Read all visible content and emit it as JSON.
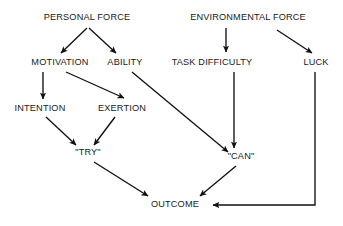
{
  "diagram": {
    "type": "flow-diagram",
    "stroke_color": "#111111",
    "background_color": "#ffffff",
    "text_color": "#1a1a1a",
    "nodes": [
      {
        "id": "personal-force",
        "label": "PERSONAL FORCE",
        "x": 87,
        "y": 18
      },
      {
        "id": "environmental-force",
        "label": "ENVIRONMENTAL FORCE",
        "x": 248,
        "y": 18
      },
      {
        "id": "motivation",
        "label": "MOTIVATION",
        "x": 60,
        "y": 63
      },
      {
        "id": "ability",
        "label": "ABILITY",
        "x": 125,
        "y": 63
      },
      {
        "id": "task-difficulty",
        "label": "TASK DIFFICULTY",
        "x": 212,
        "y": 63
      },
      {
        "id": "luck",
        "label": "LUCK",
        "x": 316,
        "y": 63
      },
      {
        "id": "intention",
        "label": "INTENTION",
        "x": 40,
        "y": 109
      },
      {
        "id": "exertion",
        "label": "EXERTION",
        "x": 122,
        "y": 109
      },
      {
        "id": "try",
        "label": "\"TRY\"",
        "x": 88,
        "y": 153
      },
      {
        "id": "can",
        "label": "\"CAN\"",
        "x": 241,
        "y": 157
      },
      {
        "id": "outcome",
        "label": "OUTCOME",
        "x": 175,
        "y": 205
      }
    ],
    "edges": [
      {
        "id": "personal-force-to-motivation",
        "from": "personal-force",
        "to": "motivation",
        "kind": "line"
      },
      {
        "id": "personal-force-to-ability",
        "from": "personal-force",
        "to": "ability",
        "kind": "line"
      },
      {
        "id": "environmental-force-to-task",
        "from": "environmental-force",
        "to": "task-difficulty",
        "kind": "line"
      },
      {
        "id": "environmental-force-to-luck",
        "from": "environmental-force",
        "to": "luck",
        "kind": "line"
      },
      {
        "id": "motivation-to-intention",
        "from": "motivation",
        "to": "intention",
        "kind": "line"
      },
      {
        "id": "motivation-to-exertion",
        "from": "motivation",
        "to": "exertion",
        "kind": "line"
      },
      {
        "id": "ability-to-can",
        "from": "ability",
        "to": "can",
        "kind": "line"
      },
      {
        "id": "intention-to-try",
        "from": "intention",
        "to": "try",
        "kind": "line"
      },
      {
        "id": "exertion-to-try",
        "from": "exertion",
        "to": "try",
        "kind": "line"
      },
      {
        "id": "task-difficulty-to-can",
        "from": "task-difficulty",
        "to": "can",
        "kind": "line"
      },
      {
        "id": "try-to-outcome",
        "from": "try",
        "to": "outcome",
        "kind": "line"
      },
      {
        "id": "can-to-outcome",
        "from": "can",
        "to": "outcome",
        "kind": "line"
      },
      {
        "id": "luck-to-outcome",
        "from": "luck",
        "to": "outcome",
        "kind": "elbow"
      }
    ]
  }
}
